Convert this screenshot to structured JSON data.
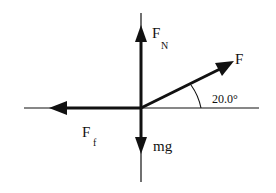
{
  "diagram": {
    "title": "",
    "type": "free-body-diagram",
    "colors": {
      "ink": "#111111",
      "background": "#ffffff"
    },
    "axes": {
      "horizontal": {
        "x1": 24,
        "x2": 259,
        "y": 108
      },
      "vertical": {
        "x": 141,
        "y1": 13,
        "y2": 182
      }
    },
    "forces": [
      {
        "id": "normal",
        "label_main": "F",
        "label_sub": "N",
        "direction": "up"
      },
      {
        "id": "applied",
        "label_main": "F",
        "label_sub": "",
        "direction": "up-right",
        "angle_deg": 20.0
      },
      {
        "id": "friction",
        "label_main": "F",
        "label_sub": "f",
        "direction": "left"
      },
      {
        "id": "weight",
        "label_main": "mg",
        "label_sub": "",
        "direction": "down"
      }
    ],
    "angle_annotation": {
      "text": "20.0°",
      "value": 20.0,
      "unit": "degrees"
    }
  }
}
